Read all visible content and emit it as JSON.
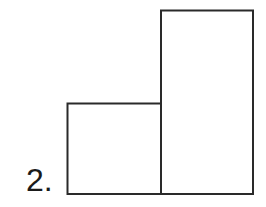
{
  "figure": {
    "label": "2.",
    "stroke_color": "#2a2a2a",
    "background": "#ffffff"
  },
  "shapes": [
    {
      "name": "left-square",
      "x": 67,
      "y": 103,
      "width": 94,
      "height": 91
    },
    {
      "name": "right-tall-rectangle",
      "x": 161,
      "y": 10,
      "width": 92,
      "height": 184
    }
  ]
}
